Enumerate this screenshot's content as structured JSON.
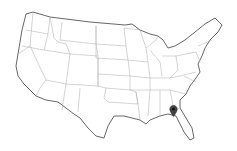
{
  "map": {
    "title": "United States",
    "style": "outline",
    "background": "#ffffff",
    "border_color": "#9a9a9a",
    "coast_color": "#555555"
  },
  "marker": {
    "icon": "map-pin-icon",
    "color": "#333333",
    "location_label": "North Florida / South Georgia",
    "x": 173,
    "y": 112
  }
}
